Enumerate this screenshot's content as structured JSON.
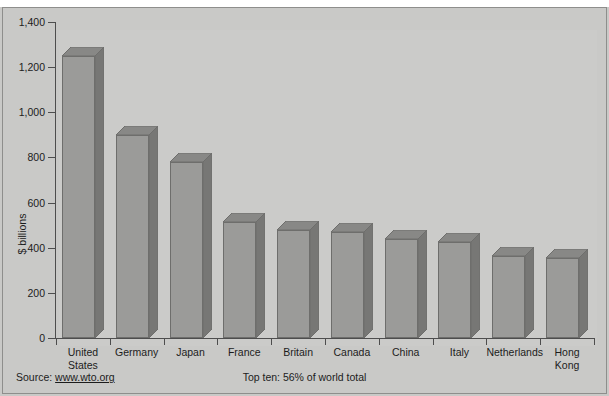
{
  "chart_data": {
    "type": "bar",
    "title": "",
    "subtitle": "Top ten: 56% of world total",
    "source": "Source:",
    "source_url": "www.wto.org",
    "xlabel": "",
    "ylabel": "$ billions",
    "ylim": [
      0,
      1400
    ],
    "ytick_labels": [
      "1,400",
      "1,200",
      "1,000",
      "800",
      "600",
      "400",
      "200",
      "0"
    ],
    "ytick_values": [
      1400,
      1200,
      1000,
      800,
      600,
      400,
      200,
      0
    ],
    "grid": false,
    "legend": "none",
    "categories": [
      "United\nStates",
      "Germany",
      "Japan",
      "France",
      "Britain",
      "Canada",
      "China",
      "Italy",
      "Netherlands",
      "Hong\nKong"
    ],
    "values": [
      1250,
      900,
      780,
      515,
      480,
      470,
      440,
      425,
      365,
      355
    ],
    "colors": {
      "bar_front": "#9b9b99",
      "bar_top": "#888886",
      "bar_side": "#777775",
      "bar_edge": "#6e6e6c",
      "plot_background": "#cbcbc9",
      "figure_background": "#c9c9c7",
      "axis": "#4d4d4d",
      "text": "#1c1c1c"
    }
  }
}
